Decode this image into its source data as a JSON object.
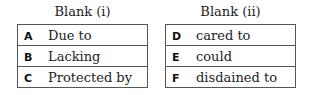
{
  "blanks": [
    {
      "title": "Blank (i)",
      "options": [
        {
          "letter": "A",
          "text": "Due to"
        },
        {
          "letter": "B",
          "text": "Lacking"
        },
        {
          "letter": "C",
          "text": "Protected by"
        }
      ]
    },
    {
      "title": "Blank (ii)",
      "options": [
        {
          "letter": "D",
          "text": "cared to"
        },
        {
          "letter": "E",
          "text": "could"
        },
        {
          "letter": "F",
          "text": "disdained to"
        }
      ]
    }
  ]
}
